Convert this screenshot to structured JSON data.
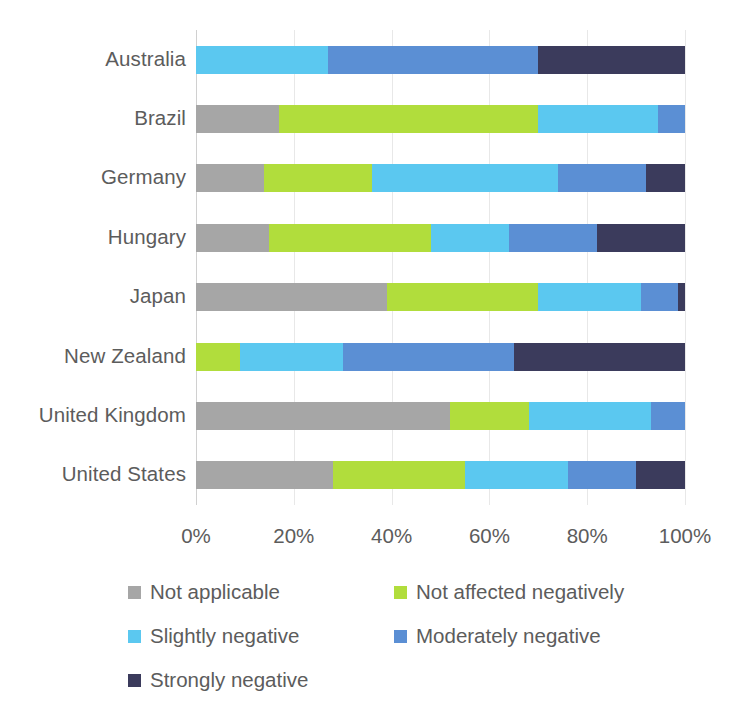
{
  "chart_data": {
    "type": "bar",
    "orientation": "horizontal",
    "stacked": true,
    "stack_mode": "percent",
    "title": "",
    "xlabel": "",
    "ylabel": "",
    "xlim": [
      0,
      100
    ],
    "xticks": [
      "0%",
      "20%",
      "40%",
      "60%",
      "80%",
      "100%"
    ],
    "xtick_values": [
      0,
      20,
      40,
      60,
      80,
      100
    ],
    "grid": true,
    "grid_axis": "x",
    "legend_position": "bottom",
    "categories": [
      "Australia",
      "Brazil",
      "Germany",
      "Hungary",
      "Japan",
      "New Zealand",
      "United Kingdom",
      "United States"
    ],
    "series": [
      {
        "name": "Not applicable",
        "color": "#a6a6a6",
        "values": [
          0,
          17,
          14,
          15,
          39,
          0,
          52,
          28
        ]
      },
      {
        "name": "Not affected negatively",
        "color": "#b1dd3c",
        "values": [
          0,
          53,
          22,
          33,
          31,
          9,
          16,
          27
        ]
      },
      {
        "name": "Slightly negative",
        "color": "#5bc8f0",
        "values": [
          27,
          24.5,
          38,
          16,
          21,
          21,
          25,
          21
        ]
      },
      {
        "name": "Moderately negative",
        "color": "#5b8fd4",
        "values": [
          43,
          5.5,
          18,
          18,
          7.5,
          35,
          7,
          14
        ]
      },
      {
        "name": "Strongly negative",
        "color": "#3b3b5c",
        "values": [
          30,
          0,
          8,
          18,
          1.5,
          35,
          0,
          10
        ]
      }
    ]
  },
  "legend": {
    "items": [
      {
        "label": "Not applicable",
        "color": "#a6a6a6"
      },
      {
        "label": "Not affected negatively",
        "color": "#b1dd3c"
      },
      {
        "label": "Slightly negative",
        "color": "#5bc8f0"
      },
      {
        "label": "Moderately negative",
        "color": "#5b8fd4"
      },
      {
        "label": "Strongly negative",
        "color": "#3b3b5c"
      }
    ]
  }
}
